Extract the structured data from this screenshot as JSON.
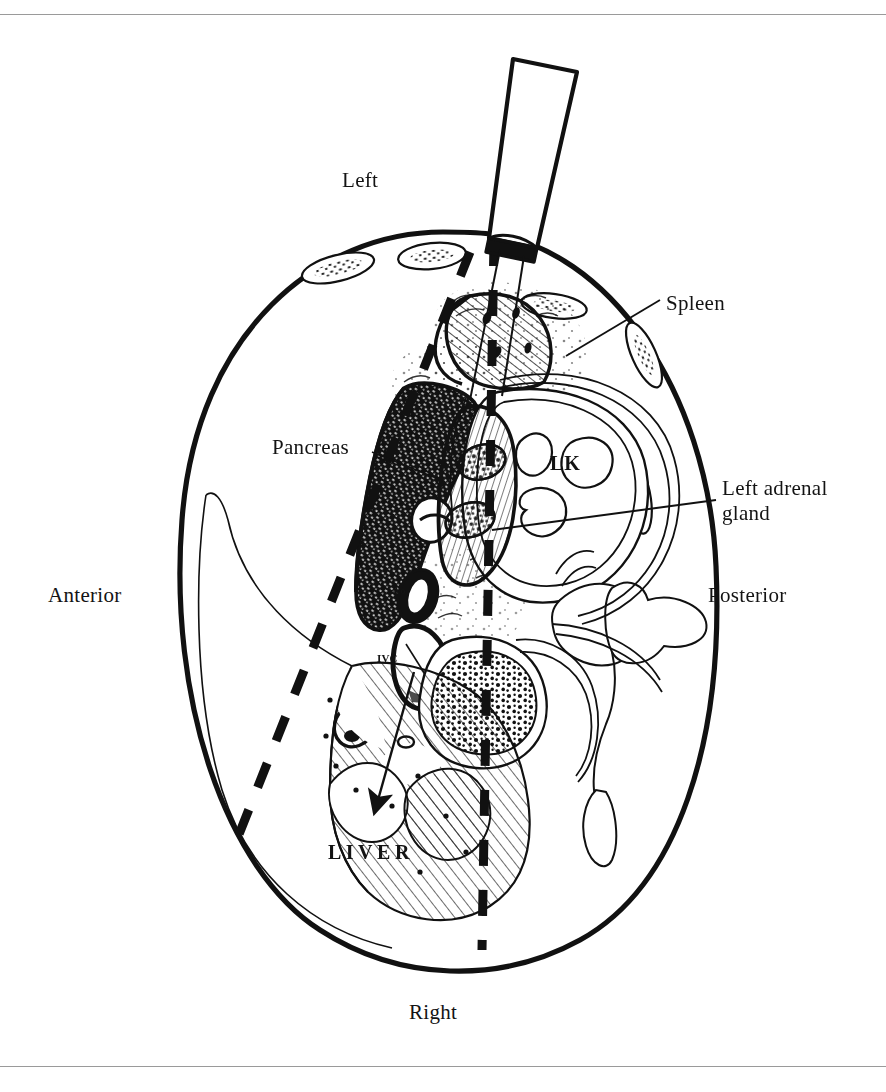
{
  "figure": {
    "kind": "anatomy-illustration",
    "background_color": "#ffffff",
    "ink_color": "#111111",
    "rule_color": "#9a9a9a"
  },
  "orientation_labels": {
    "top": "Left",
    "bottom": "Right",
    "left": "Anterior",
    "right": "Posterior"
  },
  "organ_labels": {
    "spleen": "Spleen",
    "pancreas": "Pancreas",
    "left_adrenal_gland": "Left adrenal\ngland",
    "liver": "LIVER",
    "left_kidney_abbrev": "LK",
    "aorta_abbrev": "Ao",
    "inferior_vena_cava_abbrev": "IVC"
  },
  "annotations": {
    "scan_plane": "dashed scan-plane lines",
    "transducer": "ultrasound transducer probe",
    "liver_arrow": "arrow into liver"
  }
}
